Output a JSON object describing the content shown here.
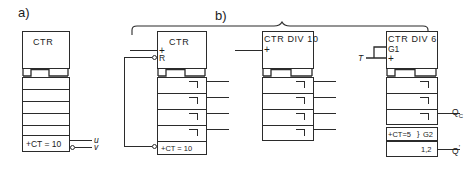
{
  "figure": {
    "type": "iec-counter-symbols",
    "section_a_label": "a)",
    "section_b_label": "b)"
  },
  "blocks": {
    "a": {
      "title": "CTR",
      "content_label": "+CT = 10",
      "stage_count": 4,
      "outputs": [
        {
          "name": "u",
          "label": "u",
          "inverted": false
        },
        {
          "name": "v",
          "label": "v",
          "inverted": true
        }
      ]
    },
    "b1": {
      "title": "CTR",
      "content_label": "+CT = 10",
      "stage_count": 4,
      "inputs": [
        {
          "name": "count",
          "label": "+",
          "inverted": false
        },
        {
          "name": "reset",
          "label": "R",
          "inverted": true
        }
      ],
      "stage_outputs": [
        "",
        "",
        "",
        ""
      ]
    },
    "b2": {
      "title": "CTR DIV 10",
      "stage_count": 4,
      "inputs": [
        {
          "name": "count",
          "label": "+",
          "inverted": false
        }
      ],
      "stage_outputs": [
        "",
        "",
        "",
        ""
      ]
    },
    "b3": {
      "title": "CTR DIV 6",
      "qualifier_label": "G1",
      "plus_label": "+",
      "content_label": "+CT=5",
      "content_qualifier": "G2",
      "bottom_label": "1,2",
      "input_label": "T",
      "stage_count": 3,
      "outputs": [
        {
          "name": "qc",
          "label_main": "Q",
          "label_sub": "C"
        },
        {
          "name": "qprime",
          "label_main": "Q",
          "label_sup": "'"
        }
      ]
    }
  },
  "colors": {
    "line": "#2b2b2b",
    "text": "#1b1b1b",
    "background": "#ffffff"
  }
}
